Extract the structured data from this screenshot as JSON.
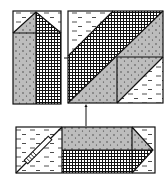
{
  "diagram": {
    "title": "",
    "colors": {
      "background": "#ffffff",
      "outline": "#111111",
      "dotted_fill": "#bdbdbd",
      "dots": "#333333",
      "crosshatch_line": "#111111",
      "dash": "#222222"
    },
    "fabrics": [
      {
        "id": "light",
        "name": "light-dashed-fabric"
      },
      {
        "id": "medium",
        "name": "medium-dotted-fabric"
      },
      {
        "id": "dark",
        "name": "dark-crosshatch-fabric"
      }
    ],
    "units": [
      {
        "id": "left-unit",
        "name": "vertical-rectangle-unit"
      },
      {
        "id": "square-unit",
        "name": "diagonal-square-unit"
      },
      {
        "id": "bottom-unit",
        "name": "horizontal-strip-unit"
      }
    ],
    "arrows": [
      {
        "from": "left-unit",
        "to": "square-unit"
      },
      {
        "from": "bottom-unit",
        "to": "square-unit"
      }
    ],
    "tool": {
      "name": "ruler"
    }
  }
}
